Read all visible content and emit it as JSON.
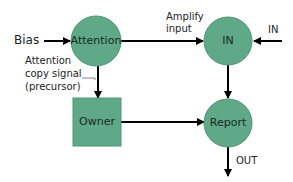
{
  "diagram": {
    "colors": {
      "node_fill": "#5fa888",
      "node_stroke": "#4f9578",
      "edge": "#000000",
      "background": "#ffffff"
    },
    "nodes": [
      {
        "id": "attention",
        "label": "Attention",
        "shape": "circle"
      },
      {
        "id": "in",
        "label": "IN",
        "shape": "circle"
      },
      {
        "id": "owner",
        "label": "Owner",
        "shape": "square"
      },
      {
        "id": "report",
        "label": "Report",
        "shape": "circle"
      }
    ],
    "edges": [
      {
        "from": "bias",
        "to": "attention",
        "label": "Bias"
      },
      {
        "from": "attention",
        "to": "in",
        "label": "Amplify input"
      },
      {
        "from": "external",
        "to": "in",
        "label": "IN"
      },
      {
        "from": "attention",
        "to": "owner",
        "label": "Attention copy signal (precursor)"
      },
      {
        "from": "in",
        "to": "report",
        "label": ""
      },
      {
        "from": "owner",
        "to": "report",
        "label": ""
      },
      {
        "from": "report",
        "to": "output",
        "label": "OUT"
      }
    ],
    "labels": {
      "bias": "Bias",
      "amplify_line1": "Amplify",
      "amplify_line2": "input",
      "in_external": "IN",
      "copy_line1": "Attention",
      "copy_line2": "copy signal",
      "copy_line3": "(precursor)",
      "out": "OUT"
    }
  }
}
